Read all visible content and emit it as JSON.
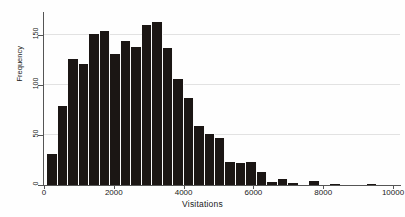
{
  "chart_data": {
    "type": "bar",
    "title": "",
    "subtitle": "",
    "xlabel": "Visitations",
    "ylabel": "Frequency",
    "xlim": [
      0,
      10200
    ],
    "ylim": [
      0,
      173
    ],
    "grid": true,
    "legend": null,
    "legend_position": "none",
    "bar_color": "#1b1614",
    "bin_width": 300,
    "x_ticks": [
      0,
      2000,
      4000,
      6000,
      8000,
      10000
    ],
    "x_tick_labels": [
      "0",
      "2000",
      "4000",
      "6000",
      "8000",
      "10000"
    ],
    "y_ticks": [
      0,
      50,
      100,
      150
    ],
    "y_tick_labels": [
      "0",
      "50",
      "100",
      "150"
    ],
    "categories": [
      250,
      550,
      850,
      1150,
      1450,
      1750,
      2050,
      2350,
      2650,
      2950,
      3250,
      3550,
      3850,
      4150,
      4450,
      4750,
      5050,
      5350,
      5650,
      5950,
      6250,
      6550,
      6850,
      7150,
      7450,
      7750,
      8050,
      8350,
      9400
    ],
    "values": [
      31,
      79,
      126,
      121,
      151,
      154,
      131,
      144,
      138,
      160,
      163,
      137,
      106,
      87,
      59,
      51,
      47,
      23,
      22,
      23,
      13,
      3,
      6,
      2,
      0,
      4,
      0,
      1,
      1
    ],
    "bin_edges": [
      100,
      400,
      700,
      1000,
      1300,
      1600,
      1900,
      2200,
      2500,
      2800,
      3100,
      3400,
      3700,
      4000,
      4300,
      4600,
      4900,
      5200,
      5500,
      5800,
      6100,
      6400,
      6700,
      7000,
      7300,
      7600,
      7900,
      8200,
      8500,
      9250,
      9550
    ],
    "n_bars": 29,
    "annotations": []
  }
}
